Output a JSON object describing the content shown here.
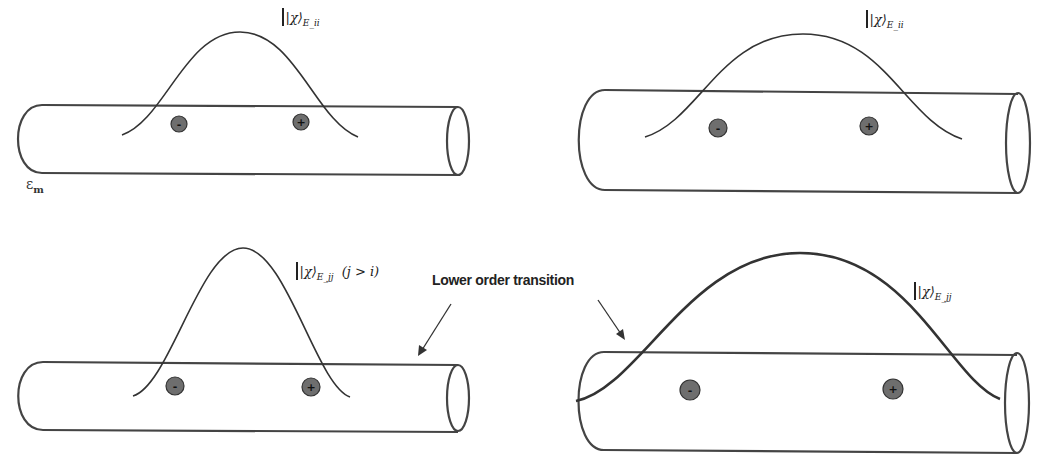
{
  "diagram": {
    "panels": [
      {
        "id": "top-left",
        "wavefunction_label": "|χ⟩",
        "wavefunction_subscript": "E_ii",
        "charges": [
          "-",
          "+"
        ],
        "medium_label": "ε",
        "medium_subscript": "m"
      },
      {
        "id": "top-right",
        "wavefunction_label": "|χ⟩",
        "wavefunction_subscript": "E_ii",
        "charges": [
          "-",
          "+"
        ]
      },
      {
        "id": "bottom-left",
        "wavefunction_label": "|χ⟩",
        "wavefunction_subscript": "E_jj",
        "condition": "(j > i)",
        "charges": [
          "-",
          "+"
        ]
      },
      {
        "id": "bottom-right",
        "wavefunction_label": "|χ⟩",
        "wavefunction_subscript": "E_jj",
        "charges": [
          "-",
          "+"
        ]
      }
    ],
    "annotation": {
      "text": "Lower order transition",
      "arrows_to": [
        "bottom-left",
        "bottom-right"
      ]
    },
    "colors": {
      "stroke": "#444444",
      "charge_fill": "#6e6e6e",
      "background": "#ffffff"
    }
  }
}
